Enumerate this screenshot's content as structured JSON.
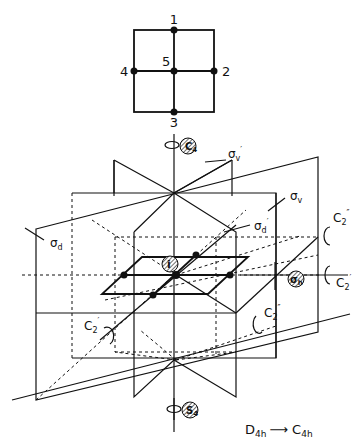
{
  "square": {
    "labels": [
      {
        "id": "1",
        "text": "1"
      },
      {
        "id": "2",
        "text": "2"
      },
      {
        "id": "3",
        "text": "3"
      },
      {
        "id": "4",
        "text": "4"
      },
      {
        "id": "5",
        "text": "5"
      }
    ]
  },
  "elements": {
    "C4": {
      "base": "C",
      "sub": "4"
    },
    "sigma_v_prime": {
      "base": "σ",
      "sub": "v",
      "prime": "′"
    },
    "sigma_v": {
      "base": "σ",
      "sub": "v"
    },
    "sigma_d": {
      "base": "σ",
      "sub": "d"
    },
    "sigma_d_prime": {
      "base": "σ",
      "sub": "d",
      "prime": "′"
    },
    "C2_dprime_top": {
      "base": "C",
      "sub": "2",
      "prime": "″"
    },
    "C2_prime_right": {
      "base": "C",
      "sub": "2",
      "prime": "′"
    },
    "C2_dprime_mid": {
      "base": "C",
      "sub": "2",
      "prime": "″"
    },
    "C2_prime_left": {
      "base": "C",
      "sub": "2",
      "prime": "′"
    },
    "i": {
      "text": "i"
    },
    "sigma_h": {
      "base": "σ",
      "sub": "h"
    },
    "S4": {
      "base": "S",
      "sub": "4"
    }
  },
  "caption": {
    "from": "D",
    "from_sub": "4h",
    "arrow": "⟶",
    "to": "C",
    "to_sub": "4h"
  }
}
